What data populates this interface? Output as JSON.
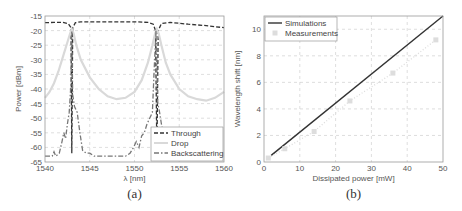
{
  "chart_data": [
    {
      "id": "a",
      "type": "line",
      "caption": "(a)",
      "title": "",
      "xlabel": "λ [nm]",
      "ylabel": "Power [dBm]",
      "xlim": [
        1540,
        1560
      ],
      "ylim": [
        -65,
        -15
      ],
      "xticks": [
        1540,
        1545,
        1550,
        1555,
        1560
      ],
      "yticks": [
        -15,
        -20,
        -25,
        -30,
        -35,
        -40,
        -45,
        -50,
        -55,
        -60,
        -65
      ],
      "grid": true,
      "legend_position": "lower right",
      "series": [
        {
          "name": "Through",
          "style": "dashed",
          "color": "#333333",
          "x": [
            1540,
            1541,
            1542,
            1542.6,
            1542.9,
            1543.0,
            1543.1,
            1543.4,
            1544,
            1546,
            1548,
            1550,
            1551.5,
            1552.1,
            1552.35,
            1552.5,
            1552.65,
            1553,
            1554,
            1556,
            1558,
            1560
          ],
          "y": [
            -17.3,
            -17.2,
            -17.2,
            -17.6,
            -19.0,
            -62.0,
            -19.0,
            -17.3,
            -17.0,
            -17.0,
            -17.0,
            -17.0,
            -17.2,
            -17.8,
            -20.0,
            -62.0,
            -20.0,
            -17.6,
            -17.2,
            -17.8,
            -18.3,
            -19.0
          ]
        },
        {
          "name": "Drop",
          "style": "solid",
          "color": "#d9d9d9",
          "x": [
            1540,
            1540.5,
            1541,
            1541.5,
            1542,
            1542.5,
            1542.8,
            1543.0,
            1543.2,
            1543.5,
            1544,
            1545,
            1546,
            1547,
            1548,
            1549,
            1550,
            1550.8,
            1551.5,
            1552.0,
            1552.3,
            1552.5,
            1552.7,
            1553,
            1553.5,
            1554,
            1555,
            1556,
            1557,
            1558,
            1558.5,
            1559,
            1559.5,
            1560
          ],
          "y": [
            -43,
            -41,
            -38,
            -34,
            -29,
            -24,
            -21,
            -19.5,
            -21,
            -25,
            -30,
            -36,
            -40,
            -42.5,
            -43.5,
            -43,
            -41,
            -37,
            -31,
            -25,
            -21,
            -19.5,
            -21,
            -25,
            -31,
            -35,
            -40,
            -42.5,
            -43.5,
            -44,
            -43.5,
            -43,
            -42,
            -41
          ]
        },
        {
          "name": "Backscattering",
          "style": "dashdot",
          "color": "#777777",
          "x": [
            1540,
            1540.8,
            1541,
            1541.2,
            1541.6,
            1541.9,
            1542.1,
            1542.3,
            1542.5,
            1542.7,
            1542.9,
            1543.0,
            1543.1,
            1543.3,
            1543.6,
            1543.9,
            1544.2,
            1544.6,
            1545,
            1545.5,
            1546,
            1547,
            1548,
            1549,
            1549.5,
            1549.9,
            1550.2,
            1550.5,
            1550.8,
            1551.1,
            1551.4,
            1551.7,
            1552.0,
            1552.2,
            1552.4,
            1552.6,
            1552.8,
            1553.0,
            1553.3,
            1553.6
          ],
          "y": [
            -63,
            -63,
            -61.5,
            -63,
            -62,
            -58,
            -55,
            -57,
            -52,
            -48,
            -38,
            -20,
            -42,
            -46,
            -48,
            -55,
            -61,
            -62,
            -62,
            -63,
            -63,
            -63,
            -63,
            -63,
            -62,
            -60,
            -58,
            -60,
            -56,
            -55,
            -52,
            -50,
            -48,
            -33,
            -20,
            -45,
            -48,
            -52,
            -56,
            -62
          ]
        }
      ]
    },
    {
      "id": "b",
      "type": "line",
      "caption": "(b)",
      "title": "",
      "xlabel": "Dissipated power [mW]",
      "ylabel": "Wavelength shift [nm]",
      "xlim": [
        0,
        50
      ],
      "ylim": [
        0,
        11
      ],
      "xticks": [
        0,
        10,
        20,
        30,
        40,
        50
      ],
      "yticks": [
        0,
        2,
        4,
        6,
        8,
        10
      ],
      "grid": true,
      "legend_position": "upper left",
      "series": [
        {
          "name": "Simulations",
          "style": "solid",
          "color": "#333333",
          "x": [
            2,
            50
          ],
          "y": [
            0.5,
            11.0
          ]
        },
        {
          "name": "Measurements",
          "style": "markers-with-dotted-line",
          "color": "#dddddd",
          "x": [
            1.2,
            5.8,
            14,
            24,
            36,
            48
          ],
          "y": [
            0.3,
            1.0,
            2.3,
            4.6,
            6.7,
            9.2
          ]
        }
      ]
    }
  ],
  "figure": {
    "panel_a": {
      "caption": "(a)",
      "xlabel": "λ [nm]",
      "ylabel": "Power [dBm]",
      "xtick_labels": [
        "1540",
        "1545",
        "1550",
        "1555",
        "1560"
      ],
      "ytick_labels": [
        "-15",
        "-20",
        "-25",
        "-30",
        "-35",
        "-40",
        "-45",
        "-50",
        "-55",
        "-60",
        "-65"
      ],
      "legend": [
        "Through",
        "Drop",
        "Backscattering"
      ]
    },
    "panel_b": {
      "caption": "(b)",
      "xlabel": "Dissipated power [mW]",
      "ylabel": "Wavelength shift [nm]",
      "xtick_labels": [
        "0",
        "10",
        "20",
        "30",
        "40",
        "50"
      ],
      "ytick_labels": [
        "0",
        "2",
        "4",
        "6",
        "8",
        "10"
      ],
      "legend": [
        "Simulations",
        "Measurements"
      ]
    }
  }
}
